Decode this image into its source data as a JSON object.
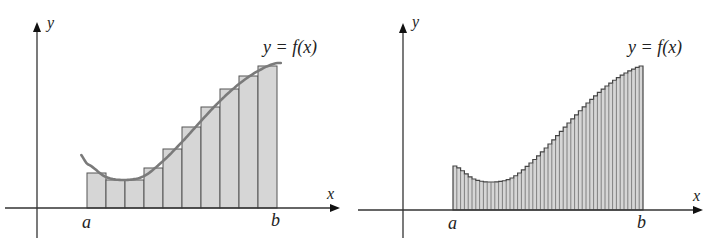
{
  "figure": {
    "left": {
      "title": "Riemann sum with 10 rectangles",
      "y_axis_label": "y",
      "x_axis_label": "x",
      "a_label": "a",
      "b_label": "b",
      "curve_label": "y = f(x)",
      "n_rectangles": 10
    },
    "right": {
      "title": "Riemann sum with many thin rectangles",
      "y_axis_label": "y",
      "x_axis_label": "x",
      "a_label": "a",
      "b_label": "b",
      "curve_label": "y = f(x)",
      "n_rectangles": 50
    },
    "colors": {
      "axis": "#333333",
      "rect_fill": "#d6d6d6",
      "rect_stroke": "#555555",
      "curve": "#7a7a7a",
      "text": "#222222"
    }
  },
  "chart_data": [
    {
      "type": "bar",
      "title": "Approximating area under y = f(x) with 10 rectangles",
      "xlabel": "x",
      "ylabel": "y",
      "x_ticks": [
        "a",
        "b"
      ],
      "categories": [
        "1",
        "2",
        "3",
        "4",
        "5",
        "6",
        "7",
        "8",
        "9",
        "10"
      ],
      "values": [
        35,
        28,
        28,
        40,
        59,
        81,
        101,
        119,
        132,
        142
      ],
      "curve": {
        "name": "y = f(x)",
        "x": [
          0,
          0.1,
          0.2,
          0.3,
          0.4,
          0.5,
          0.6,
          0.7,
          0.8,
          0.9,
          1.0
        ],
        "y": [
          44,
          31,
          28,
          32,
          47,
          66,
          87,
          107,
          124,
          137,
          145
        ]
      },
      "grid": false
    },
    {
      "type": "bar",
      "title": "Approximating area under y = f(x) with many thin rectangles",
      "xlabel": "x",
      "ylabel": "y",
      "x_ticks": [
        "a",
        "b"
      ],
      "n_rectangles": 50,
      "curve": {
        "name": "y = f(x)",
        "x": [
          0,
          0.1,
          0.2,
          0.3,
          0.4,
          0.5,
          0.6,
          0.7,
          0.8,
          0.9,
          1.0
        ],
        "y": [
          44,
          31,
          28,
          32,
          47,
          66,
          87,
          107,
          124,
          137,
          145
        ]
      },
      "grid": false
    }
  ]
}
